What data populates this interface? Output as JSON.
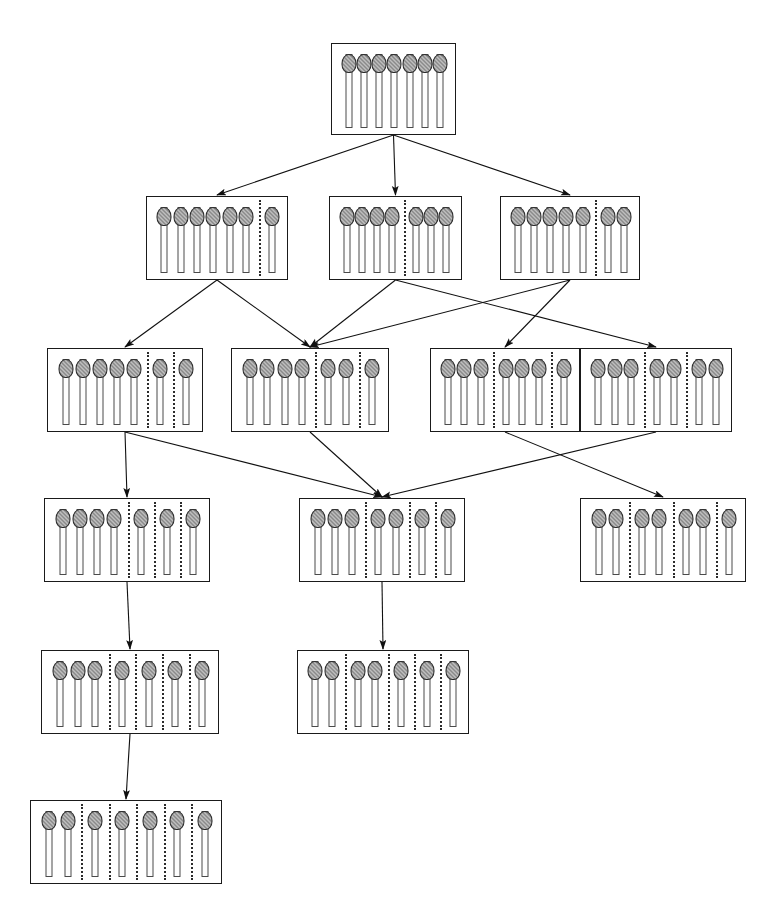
{
  "figure": {
    "caption": "",
    "background_color": "#ffffff",
    "line_color": "#1a1a1a",
    "match_head_color": "#8a8a8a",
    "match_stick_color": "#fdfdfd",
    "divider_style": "dotted"
  },
  "chart_data": {
    "type": "diagram",
    "total_matches": 7,
    "levels": 6,
    "nodes": [
      {
        "id": "n0",
        "level": 0,
        "partition": [
          7
        ],
        "groups": 1,
        "label": "7",
        "x": 331,
        "y": 43,
        "w": 125,
        "h": 92
      },
      {
        "id": "n1",
        "level": 1,
        "partition": [
          6,
          1
        ],
        "groups": 2,
        "label": "6+1",
        "x": 146,
        "y": 196,
        "w": 142,
        "h": 84
      },
      {
        "id": "n2",
        "level": 1,
        "partition": [
          4,
          3
        ],
        "groups": 2,
        "label": "4+3",
        "x": 329,
        "y": 196,
        "w": 133,
        "h": 84
      },
      {
        "id": "n3",
        "level": 1,
        "partition": [
          5,
          2
        ],
        "groups": 2,
        "label": "5+2",
        "x": 500,
        "y": 196,
        "w": 140,
        "h": 84
      },
      {
        "id": "n4",
        "level": 2,
        "partition": [
          5,
          1,
          1
        ],
        "groups": 3,
        "label": "5+1+1",
        "x": 47,
        "y": 348,
        "w": 156,
        "h": 84
      },
      {
        "id": "n5",
        "level": 2,
        "partition": [
          4,
          2,
          1
        ],
        "groups": 3,
        "label": "4+2+1",
        "x": 231,
        "y": 348,
        "w": 158,
        "h": 84
      },
      {
        "id": "n6",
        "level": 2,
        "partition": [
          3,
          3,
          1
        ],
        "groups": 3,
        "label": "3+3+1",
        "x": 430,
        "y": 348,
        "w": 150,
        "h": 84
      },
      {
        "id": "n7",
        "level": 2,
        "partition": [
          3,
          2,
          2
        ],
        "groups": 3,
        "label": "3+2+2",
        "x": 580,
        "y": 348,
        "w": 152,
        "h": 84
      },
      {
        "id": "n8",
        "level": 3,
        "partition": [
          4,
          1,
          1,
          1
        ],
        "groups": 4,
        "label": "4+1+1+1",
        "x": 44,
        "y": 498,
        "w": 166,
        "h": 84
      },
      {
        "id": "n9",
        "level": 3,
        "partition": [
          3,
          2,
          1,
          1
        ],
        "groups": 4,
        "label": "3+2+1+1",
        "x": 299,
        "y": 498,
        "w": 166,
        "h": 84
      },
      {
        "id": "n10",
        "level": 3,
        "partition": [
          2,
          2,
          2,
          1
        ],
        "groups": 4,
        "label": "2+2+2+1",
        "x": 580,
        "y": 498,
        "w": 166,
        "h": 84
      },
      {
        "id": "n11",
        "level": 4,
        "partition": [
          3,
          1,
          1,
          1,
          1
        ],
        "groups": 5,
        "label": "3+1+1+1+1",
        "x": 41,
        "y": 650,
        "w": 178,
        "h": 84
      },
      {
        "id": "n12",
        "level": 4,
        "partition": [
          2,
          2,
          1,
          1,
          1
        ],
        "groups": 5,
        "label": "2+2+1+1+1",
        "x": 297,
        "y": 650,
        "w": 172,
        "h": 84
      },
      {
        "id": "n13",
        "level": 5,
        "partition": [
          2,
          1,
          1,
          1,
          1,
          1
        ],
        "groups": 6,
        "label": "2+1+1+1+1+1",
        "x": 30,
        "y": 800,
        "w": 192,
        "h": 84
      }
    ],
    "edges": [
      {
        "from": "n0",
        "to": "n1"
      },
      {
        "from": "n0",
        "to": "n2"
      },
      {
        "from": "n0",
        "to": "n3"
      },
      {
        "from": "n1",
        "to": "n4"
      },
      {
        "from": "n1",
        "to": "n5"
      },
      {
        "from": "n2",
        "to": "n5"
      },
      {
        "from": "n2",
        "to": "n7"
      },
      {
        "from": "n3",
        "to": "n5"
      },
      {
        "from": "n3",
        "to": "n6"
      },
      {
        "from": "n4",
        "to": "n8"
      },
      {
        "from": "n4",
        "to": "n9"
      },
      {
        "from": "n5",
        "to": "n9"
      },
      {
        "from": "n7",
        "to": "n9"
      },
      {
        "from": "n6",
        "to": "n10"
      },
      {
        "from": "n8",
        "to": "n11"
      },
      {
        "from": "n9",
        "to": "n12"
      },
      {
        "from": "n11",
        "to": "n13"
      }
    ]
  }
}
